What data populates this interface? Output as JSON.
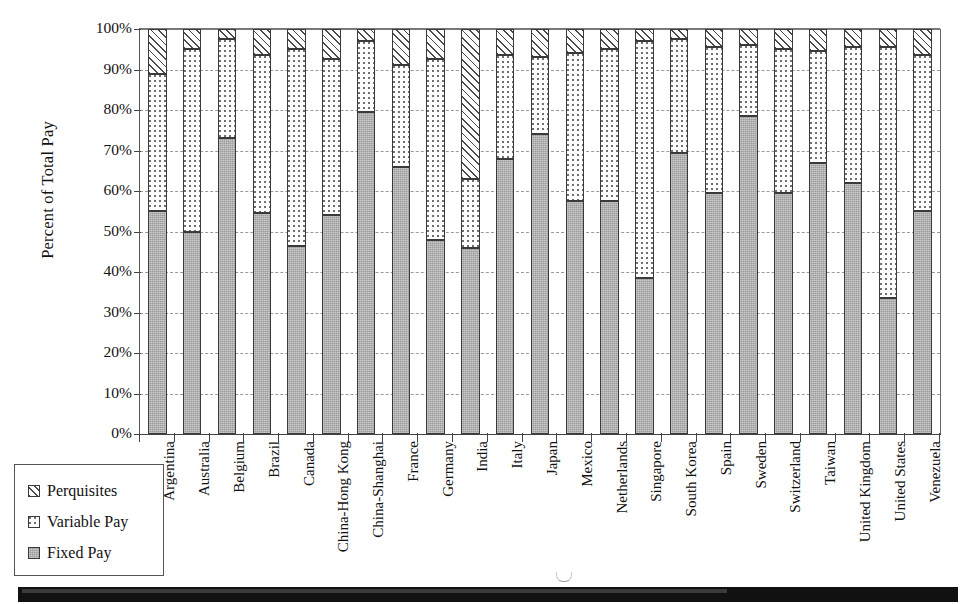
{
  "chart_data": {
    "type": "bar",
    "subtype": "stacked-bar-100pct",
    "title": "",
    "xlabel": "",
    "ylabel": "Percent of Total Pay",
    "ylim": [
      0,
      100
    ],
    "y_tick_labels": [
      "100%",
      "90%",
      "80%",
      "70%",
      "60%",
      "50%",
      "40%",
      "30%",
      "20%",
      "10%",
      "0%"
    ],
    "y_tick_values": [
      100,
      90,
      80,
      70,
      60,
      50,
      40,
      30,
      20,
      10,
      0
    ],
    "grid": true,
    "grid_axis": "y",
    "legend_position": "below-left",
    "categories": [
      "Argentina",
      "Australia",
      "Belgium",
      "Brazil",
      "Canada",
      "China-Hong Kong",
      "China-Shanghai",
      "France",
      "Germany",
      "India",
      "Italy",
      "Japan",
      "Mexico",
      "Netherlands",
      "Singapore",
      "South Korea",
      "Spain",
      "Sweden",
      "Switzerland",
      "Taiwan",
      "United Kingdom",
      "United States",
      "Venezuela"
    ],
    "series": [
      {
        "name": "Fixed Pay",
        "pattern": "solid-gray",
        "color": "#9b9b9b",
        "values": [
          55.0,
          50.0,
          73.0,
          54.5,
          46.5,
          54.0,
          79.5,
          66.0,
          48.0,
          46.0,
          68.0,
          74.0,
          57.5,
          57.5,
          38.5,
          69.5,
          59.5,
          78.5,
          59.5,
          67.0,
          62.0,
          33.5,
          55.0
        ]
      },
      {
        "name": "Variable Pay",
        "pattern": "dotted",
        "color": "#fdfdfd",
        "values": [
          34.0,
          45.0,
          24.5,
          39.0,
          48.5,
          38.5,
          17.5,
          25.0,
          44.5,
          17.0,
          25.5,
          19.0,
          36.5,
          37.5,
          58.5,
          28.0,
          36.0,
          17.5,
          35.5,
          27.5,
          33.5,
          62.0,
          38.5
        ]
      },
      {
        "name": "Perquisites",
        "pattern": "diagonal-hatch",
        "color": "#fcfcfc",
        "values": [
          11.0,
          5.0,
          2.5,
          6.5,
          5.0,
          7.5,
          3.0,
          9.0,
          7.5,
          37.0,
          6.5,
          7.0,
          6.0,
          5.0,
          3.0,
          2.5,
          4.5,
          4.0,
          5.0,
          5.5,
          4.5,
          4.5,
          6.5
        ]
      }
    ],
    "cumulative_tops": {
      "fixed_plus_variable": [
        89.0,
        95.0,
        97.5,
        93.5,
        95.0,
        92.5,
        97.0,
        91.0,
        92.5,
        63.0,
        93.5,
        93.0,
        94.0,
        95.0,
        97.0,
        97.5,
        95.5,
        96.0,
        95.0,
        94.5,
        95.5,
        95.5,
        93.5
      ]
    }
  },
  "legend": {
    "items": [
      {
        "label": "Perquisites",
        "swatch": "diagonal-hatch"
      },
      {
        "label": "Variable Pay",
        "swatch": "dotted"
      },
      {
        "label": "Fixed Pay",
        "swatch": "solid-gray"
      }
    ]
  }
}
